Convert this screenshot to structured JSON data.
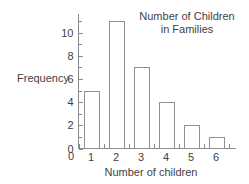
{
  "chart_data": {
    "type": "bar",
    "title": "Number of Children in Families",
    "title_line1": "Number of Children",
    "title_line2": "in Families",
    "xlabel": "Number of children",
    "ylabel": "Frequency",
    "categories": [
      "1",
      "2",
      "3",
      "4",
      "5",
      "6"
    ],
    "values": [
      5,
      11,
      7,
      4,
      2,
      1
    ],
    "ylim": [
      0,
      11.6
    ],
    "y_ticks_major": [
      "0",
      "2",
      "4",
      "6",
      "8",
      "10"
    ],
    "y_tick_major_values": [
      0,
      2,
      4,
      6,
      8,
      10
    ],
    "y_tick_minor_values": [
      1,
      3,
      5,
      7,
      9,
      11
    ],
    "x_origin_label": "0",
    "grid": "off",
    "legend": "none",
    "bar_fill": "#ffffff",
    "bar_stroke": "#8f8f8f",
    "axis_color": "#8a8a8a",
    "text_color": "#3f3f3f",
    "background": "#ffffff"
  }
}
